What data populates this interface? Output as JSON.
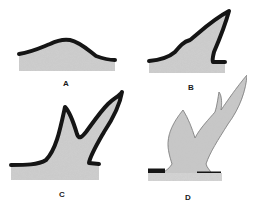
{
  "diagram": {
    "colors": {
      "fill": "#c8c8c8",
      "outline": "#151515",
      "background": "#ffffff"
    },
    "panels": [
      {
        "id": "A",
        "label": "A",
        "stage": "initial rounded swelling"
      },
      {
        "id": "B",
        "label": "B",
        "stage": "single pointed growth"
      },
      {
        "id": "C",
        "label": "C",
        "stage": "forked growth with two tines"
      },
      {
        "id": "D",
        "label": "D",
        "stage": "branched antler emerging from base"
      }
    ]
  }
}
